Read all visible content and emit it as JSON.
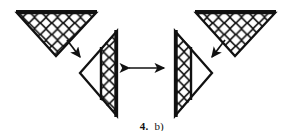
{
  "figure": {
    "caption_number": "4.",
    "caption_label": "b)",
    "ink_color": "#111111",
    "background_color": "#ffffff",
    "stroke_width_outline": 2.2,
    "stroke_width_hatch": 1.5,
    "shapes": [
      {
        "name": "top-left-triangle",
        "orientation": "pointing-down",
        "hatch": "diamond-lattice",
        "points": "17,13 96,13 56,56",
        "hatch_region": "full"
      },
      {
        "name": "top-right-triangle",
        "orientation": "pointing-down",
        "hatch": "diamond-lattice",
        "points": "196,13 275,13 235,56",
        "hatch_region": "full"
      },
      {
        "name": "middle-left-triangle",
        "orientation": "pointing-left",
        "hatch": "diamond-lattice",
        "points": "80,73 117,31 117,116",
        "hatch_region": "right-band"
      },
      {
        "name": "middle-right-triangle",
        "orientation": "pointing-right",
        "hatch": "diamond-lattice",
        "points": "212,73 175,31 175,116",
        "hatch_region": "left-band"
      }
    ],
    "arrows": [
      {
        "name": "arrow-top-left-to-middle-left",
        "direction": "down-right",
        "from": [
          67,
          41
        ],
        "to": [
          80,
          57
        ]
      },
      {
        "name": "arrow-top-right-to-middle-right",
        "direction": "down-left",
        "from": [
          225,
          41
        ],
        "to": [
          212,
          57
        ]
      },
      {
        "name": "arrow-double-headed-equivalence",
        "direction": "horizontal-both",
        "from": [
          126,
          68
        ],
        "to": [
          167,
          68
        ]
      }
    ]
  }
}
